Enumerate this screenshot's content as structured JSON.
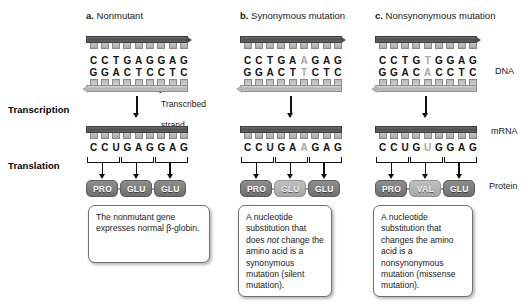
{
  "figure": {
    "stage_labels": [
      {
        "name": "transcription",
        "text": "Transcription"
      },
      {
        "name": "translation",
        "text": "Translation"
      }
    ],
    "molecule_labels": [
      {
        "name": "dna",
        "text": "DNA"
      },
      {
        "name": "mrna",
        "text": "mRNA"
      },
      {
        "name": "protein",
        "text": "Protein"
      }
    ],
    "annotation": {
      "letter_line": "Transcribed",
      "second_line": "strand"
    },
    "colors": {
      "dna_top_strand": "#4f4f4f",
      "dna_bottom_strand": "#b4b4b4",
      "amino_acid_box": "#7d7d7d",
      "amino_acid_box_faded": "#b3b3b3",
      "mutated_base": "#a8a8a8",
      "text": "#1a1a1a",
      "background": "#ffffff"
    }
  },
  "panels": [
    {
      "id": "a",
      "letter": "a.",
      "title": "Nonmutant",
      "dna_coding": [
        "C",
        "C",
        "T",
        "G",
        "A",
        "G",
        "G",
        "A",
        "G"
      ],
      "dna_template": [
        "G",
        "G",
        "A",
        "C",
        "T",
        "C",
        "C",
        "T",
        "C"
      ],
      "mutated_index": -1,
      "mrna": [
        "C",
        "C",
        "U",
        "G",
        "A",
        "G",
        "G",
        "A",
        "G"
      ],
      "mrna_mutated_index": -1,
      "amino_acids": [
        "PRO",
        "GLU",
        "GLU"
      ],
      "faded_amino_index": -1,
      "caption": "The nonmutant gene expresses normal β-globin.",
      "caption_parts": [
        {
          "text": "The nonmutant gene expresses normal β-globin.",
          "italic": false
        }
      ]
    },
    {
      "id": "b",
      "letter": "b.",
      "title": "Synonymous mutation",
      "dna_coding": [
        "C",
        "C",
        "T",
        "G",
        "A",
        "A",
        "G",
        "A",
        "G"
      ],
      "dna_template": [
        "G",
        "G",
        "A",
        "C",
        "T",
        "T",
        "C",
        "T",
        "C"
      ],
      "mutated_index": 5,
      "mrna": [
        "C",
        "C",
        "U",
        "G",
        "A",
        "A",
        "G",
        "A",
        "G"
      ],
      "mrna_mutated_index": 5,
      "amino_acids": [
        "PRO",
        "GLU",
        "GLU"
      ],
      "faded_amino_index": 1,
      "caption": "A nucleotide substitution that does not change the amino acid is a synonymous mutation (silent mutation).",
      "caption_parts": [
        {
          "text": "A nucleotide substitution that does ",
          "italic": false
        },
        {
          "text": "not",
          "italic": true
        },
        {
          "text": " change the amino acid is a synonymous mutation (silent mutation).",
          "italic": false
        }
      ]
    },
    {
      "id": "c",
      "letter": "c.",
      "title": "Nonsynonymous mutation",
      "dna_coding": [
        "C",
        "C",
        "T",
        "G",
        "T",
        "G",
        "G",
        "A",
        "G"
      ],
      "dna_template": [
        "G",
        "G",
        "A",
        "C",
        "A",
        "C",
        "C",
        "T",
        "C"
      ],
      "mutated_index": 4,
      "mrna": [
        "C",
        "C",
        "U",
        "G",
        "U",
        "G",
        "G",
        "A",
        "G"
      ],
      "mrna_mutated_index": 4,
      "amino_acids": [
        "PRO",
        "VAL",
        "GLU"
      ],
      "faded_amino_index": 1,
      "caption": "A nucleotide substitution that changes the amino acid is a nonsynonymous mutation (missense mutation).",
      "caption_parts": [
        {
          "text": "A nucleotide substitution that changes the amino acid is a nonsynonymous mutation (missense mutation).",
          "italic": false
        }
      ]
    }
  ]
}
